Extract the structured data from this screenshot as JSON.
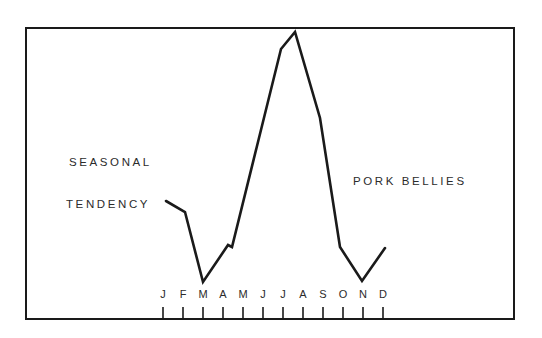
{
  "annotations": {
    "title_line1": "SEASONAL",
    "title_line2": "TENDENCY",
    "series_label": "PORK BELLIES"
  },
  "colors": {
    "line": "#1a1a1a",
    "frame": "#1a1a1a",
    "text": "#2b2b2b",
    "background": "#ffffff"
  },
  "chart_data": {
    "type": "line",
    "title": "SEASONAL TENDENCY",
    "xlabel": "",
    "ylabel": "",
    "grid": false,
    "legend_position": "inline-right",
    "axis_range_x": [
      "J",
      "D"
    ],
    "categories": [
      "J",
      "F",
      "M",
      "A",
      "M",
      "J",
      "J",
      "A",
      "S",
      "O",
      "N",
      "D"
    ],
    "tick_labels": [
      "J",
      "F",
      "M",
      "A",
      "M",
      "J",
      "J",
      "A",
      "S",
      "O",
      "N",
      "D"
    ],
    "series": [
      {
        "name": "PORK BELLIES",
        "values": [
          31,
          27,
          3,
          19,
          22,
          49,
          84,
          90,
          63,
          15,
          4,
          17
        ]
      }
    ],
    "ylim": [
      0,
      100
    ],
    "annotations": [
      {
        "text": "SEASONAL",
        "x": 69,
        "y": 156
      },
      {
        "text": "TENDENCY",
        "x": 66,
        "y": 198
      },
      {
        "text": "PORK BELLIES",
        "x": 353,
        "y": 175
      }
    ],
    "polyline_points": "166,201 185,212 203,282 228,245 232,247 281,49 295,32 320,118 340,247 362,281 385,248",
    "tick_positions_px": [
      163,
      183,
      203,
      223,
      243,
      263,
      283,
      303,
      323,
      343,
      363,
      383
    ]
  }
}
